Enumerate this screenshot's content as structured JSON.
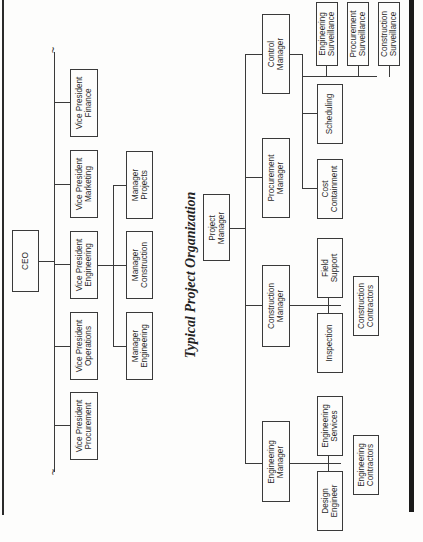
{
  "orientation": "rotated-90-ccw",
  "corporate_chart": {
    "ceo": "CEO",
    "vice_presidents": [
      "Vice President\nFinance",
      "Vice President\nMarketing",
      "Vice President\nEngineering",
      "Vice President\nOperations",
      "Vice President\nProcurement"
    ],
    "managers": [
      "Manager\nProjects",
      "Manager\nConstruction",
      "Manager\nEngineering"
    ]
  },
  "title": "Typical Project Organization",
  "project_chart": {
    "project_manager": "Project\nManager",
    "managers": {
      "control": "Control\nManager",
      "procurement": "Procurement\nManager",
      "construction": "Construction\nManager",
      "engineering": "Engineering\nManager"
    },
    "control_units": {
      "engineering_surveillance": "Engineering\nSurveillance",
      "procurement_surveillance": "Procurement\nSurveillance",
      "construction_surveillance": "Construction\nSurveillance",
      "scheduling": "Scheduling",
      "cost_containment": "Cost\nContainment"
    },
    "construction_units": {
      "field_support": "Field\nSupport",
      "inspection": "Inspection",
      "construction_contractors": "Construction\nContractors"
    },
    "engineering_units": {
      "engineering_services": "Engineering\nServices",
      "design_engineer": "Design\nEngineer",
      "engineering_contractors": "Engineering\nContractors"
    }
  }
}
